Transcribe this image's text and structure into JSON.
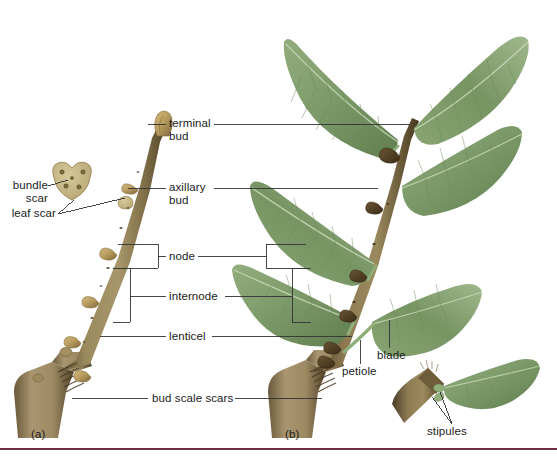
{
  "figure": {
    "subfigures": [
      {
        "id": "a",
        "label": "(a)",
        "caption": "winter twig"
      },
      {
        "id": "b",
        "label": "(b)",
        "caption": "leafy shoot"
      }
    ],
    "rule_color": "#6d2b45",
    "background": "#ffffff"
  },
  "labels": {
    "bundle_scar": "bundle\nscar",
    "leaf_scar": "leaf scar",
    "terminal_bud": "terminal\nbud",
    "axillary_bud": "axillary\nbud",
    "node": "node",
    "internode": "internode",
    "lenticel": "lenticel",
    "bud_scale_scars": "bud scale scars",
    "blade": "blade",
    "petiole": "petiole",
    "stipules": "stipules",
    "subfig_a": "(a)",
    "subfig_b": "(b)"
  },
  "colors": {
    "leaf_green": "#7d9b6a",
    "leaf_green_dark": "#5c7a4c",
    "leaf_green_light": "#a8bf95",
    "bark_brown": "#8a7a52",
    "bark_dark": "#5e4f33",
    "bud_tan": "#b49a5e",
    "scar_tan": "#c3b484",
    "leader_line": "#333333",
    "rule": "#6d2b45",
    "text": "#1b1b1b"
  },
  "icons": {
    "leaf_scar_diagram": "leaf-scar-detail",
    "twig_a": "winter-twig",
    "twig_b": "leafy-twig",
    "stipule_inset": "stipule-detail"
  }
}
